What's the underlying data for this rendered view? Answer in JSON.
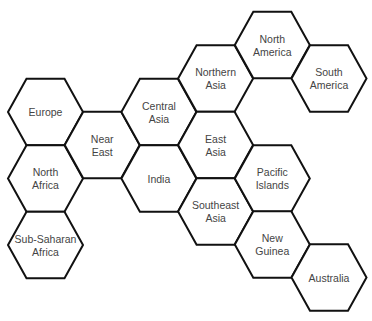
{
  "diagram": {
    "style": {
      "stroke": "#111111",
      "text": "#444444",
      "background": "#ffffff"
    },
    "geometry": {
      "x0": 45.5,
      "dx": 56.7,
      "halfWidth": 37.5,
      "halfTop": 19,
      "halfHeight": 33.3
    },
    "regions": [
      {
        "id": "europe",
        "lines": [
          "Europe"
        ],
        "col": 0,
        "cy": 112
      },
      {
        "id": "north-africa",
        "lines": [
          "North",
          "Africa"
        ],
        "col": 0,
        "cy": 178.5
      },
      {
        "id": "sub-saharan-africa",
        "lines": [
          "Sub-Saharan",
          "Africa"
        ],
        "col": 0,
        "cy": 245
      },
      {
        "id": "near-east",
        "lines": [
          "Near",
          "East"
        ],
        "col": 1,
        "cy": 145
      },
      {
        "id": "central-asia",
        "lines": [
          "Central",
          "Asia"
        ],
        "col": 2,
        "cy": 112
      },
      {
        "id": "india",
        "lines": [
          "India"
        ],
        "col": 2,
        "cy": 178.5
      },
      {
        "id": "northern-asia",
        "lines": [
          "Northern",
          "Asia"
        ],
        "col": 3,
        "cy": 78.5
      },
      {
        "id": "east-asia",
        "lines": [
          "East",
          "Asia"
        ],
        "col": 3,
        "cy": 145
      },
      {
        "id": "southeast-asia",
        "lines": [
          "Southeast",
          "Asia"
        ],
        "col": 3,
        "cy": 211.5
      },
      {
        "id": "north-america",
        "lines": [
          "North",
          "America"
        ],
        "col": 4,
        "cy": 45
      },
      {
        "id": "pacific-islands",
        "lines": [
          "Pacific",
          "Islands"
        ],
        "col": 4,
        "cy": 178.5
      },
      {
        "id": "new-guinea",
        "lines": [
          "New",
          "Guinea"
        ],
        "col": 4,
        "cy": 244.5
      },
      {
        "id": "south-america",
        "lines": [
          "South",
          "America"
        ],
        "col": 5,
        "cy": 78.5
      },
      {
        "id": "australia",
        "lines": [
          "Australia"
        ],
        "col": 5,
        "cy": 277.5
      }
    ]
  }
}
